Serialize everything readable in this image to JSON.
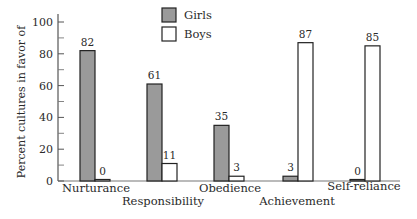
{
  "chart_data": {
    "type": "bar",
    "title": "",
    "xlabel": "",
    "ylabel": "Percent cultures in favor of",
    "ylim": [
      0,
      100
    ],
    "yticks_major": [
      0,
      20,
      40,
      60,
      80,
      100
    ],
    "yticks_minor": [
      10,
      30,
      50,
      70,
      90
    ],
    "grid": false,
    "legend_position": "top-center",
    "categories": [
      "Nurturance",
      "Responsibility",
      "Obedience",
      "Achievement",
      "Self-reliance"
    ],
    "series": [
      {
        "name": "Girls",
        "values": [
          82,
          61,
          35,
          3,
          0
        ],
        "color": "#9a9a9a"
      },
      {
        "name": "Boys",
        "values": [
          0,
          11,
          3,
          87,
          85
        ],
        "color": "#ffffff"
      }
    ],
    "data_labels": true
  }
}
